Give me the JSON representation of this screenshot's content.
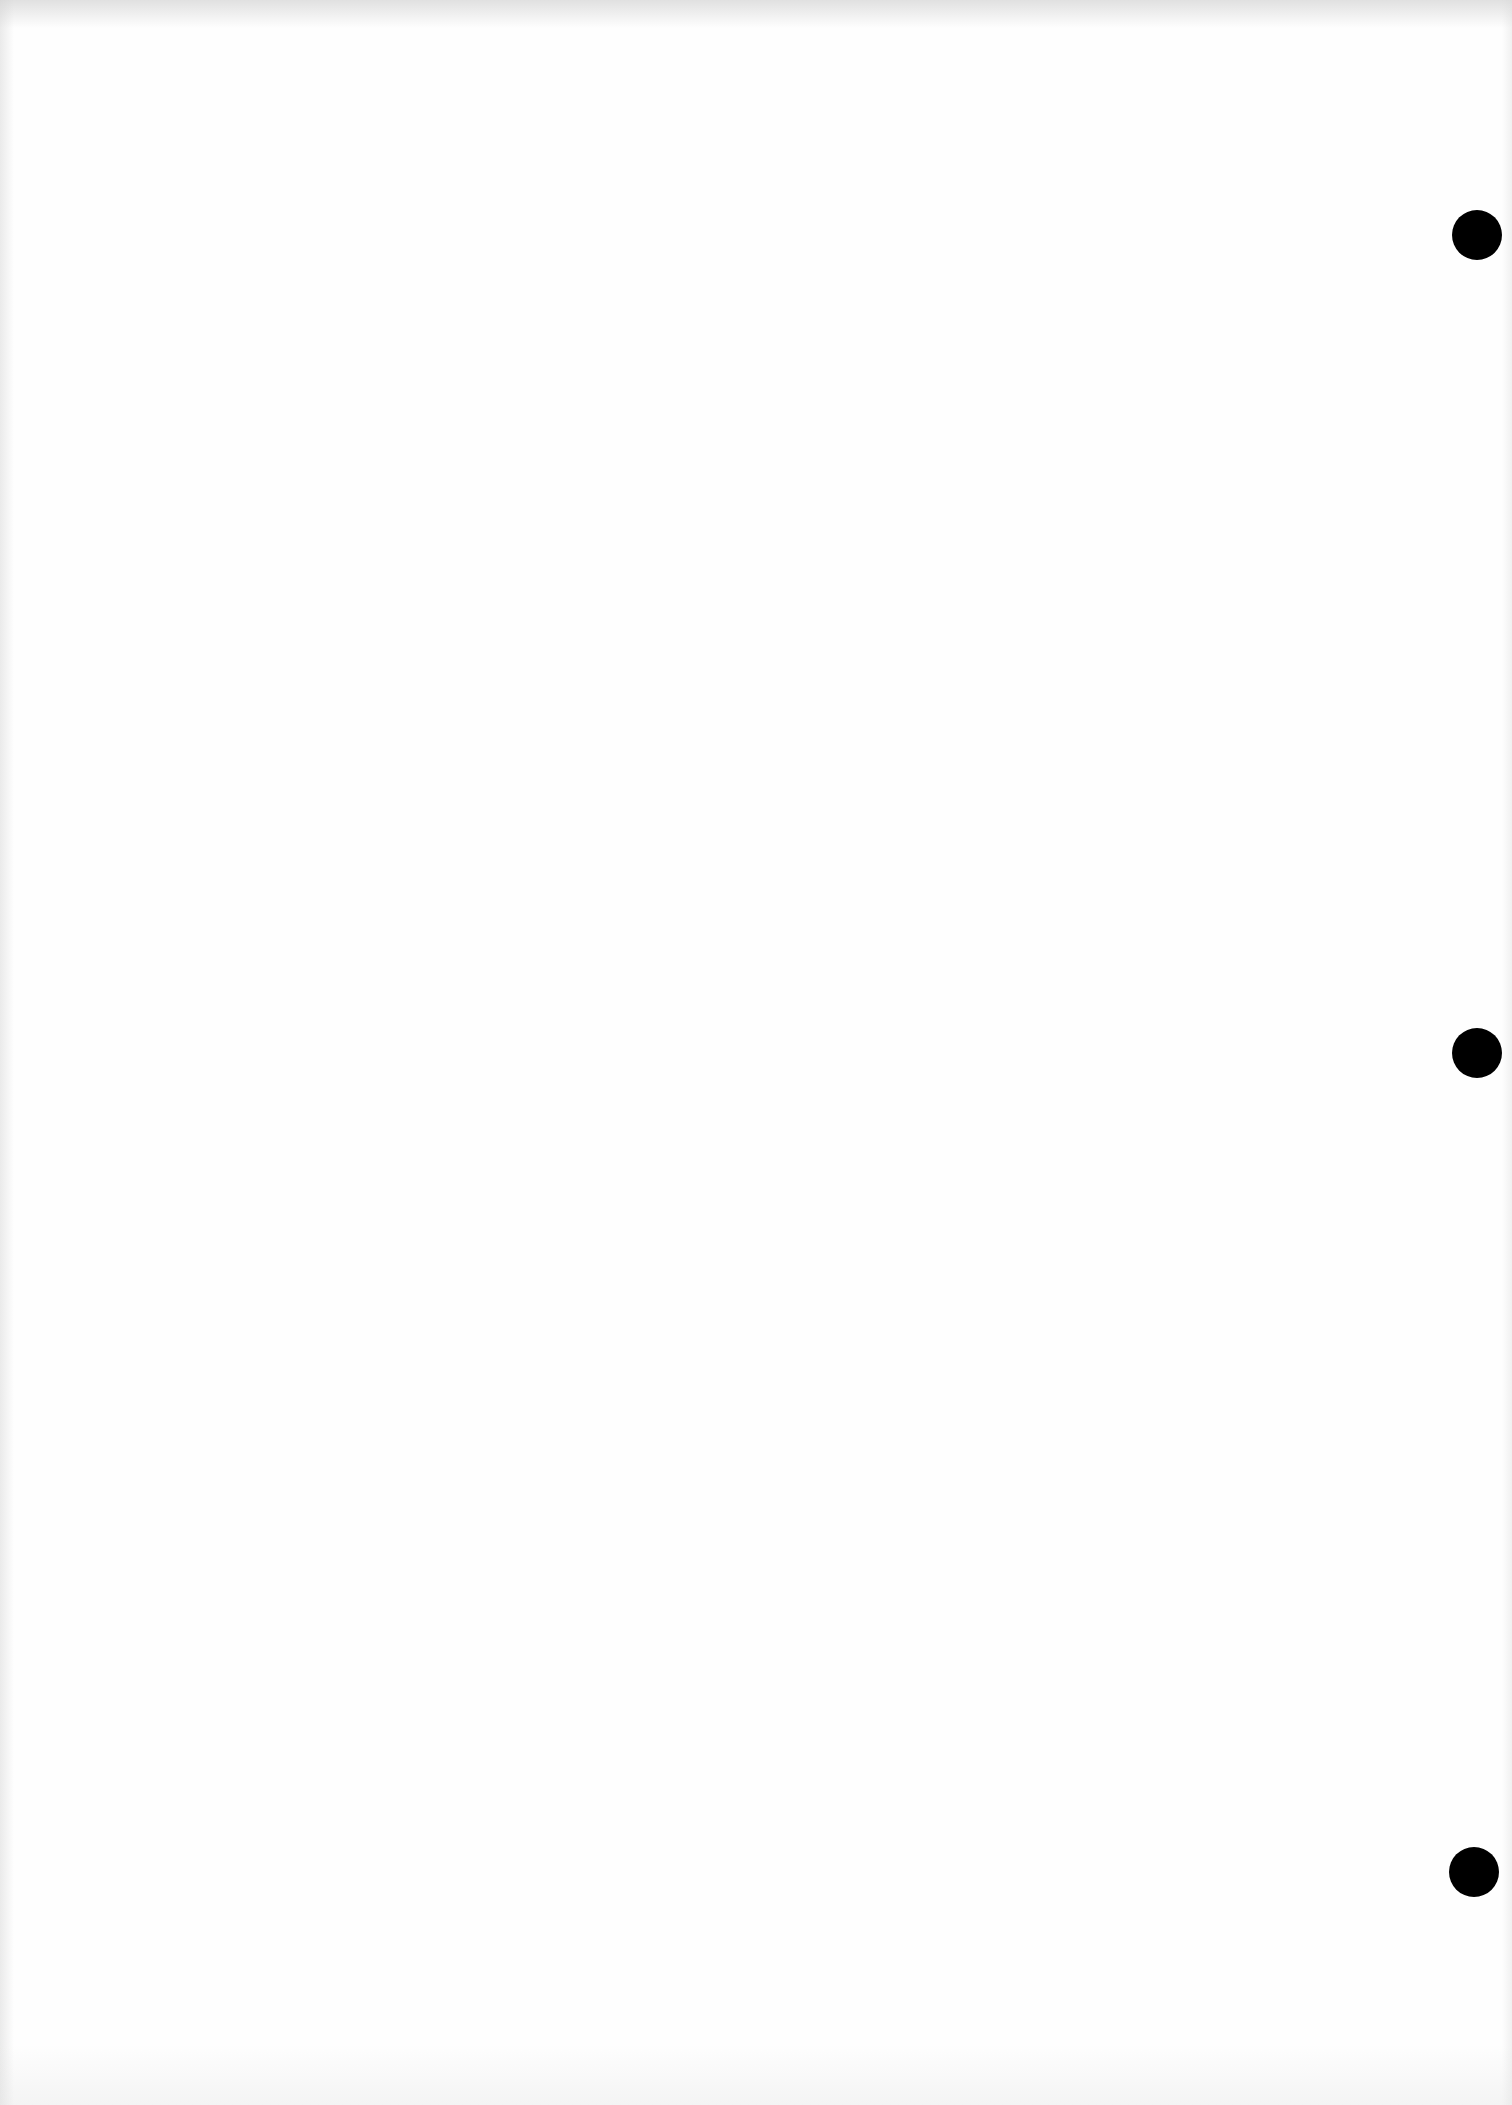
{
  "document": {
    "type": "blank-scanned-page",
    "background_color": "#fefefe",
    "text_content": []
  },
  "punch_holes": [
    {
      "cx": 1477,
      "cy": 235,
      "diameter": 50,
      "color": "#000000"
    },
    {
      "cx": 1477,
      "cy": 1053,
      "diameter": 50,
      "color": "#000000"
    },
    {
      "cx": 1474,
      "cy": 1872,
      "diameter": 50,
      "color": "#000000"
    }
  ]
}
